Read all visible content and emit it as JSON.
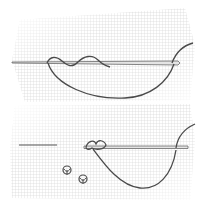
{
  "illustration": {
    "subject": "embroidery stitch diagram",
    "panels": [
      {
        "id": "top",
        "elements": [
          "fabric-grid",
          "needle",
          "wrapped-thread",
          "thread-loop"
        ]
      },
      {
        "id": "bottom",
        "elements": [
          "fabric-grid",
          "needle",
          "knot",
          "thread-loop",
          "finished-knots"
        ]
      }
    ],
    "colors": {
      "background": "#ffffff",
      "grid": "#c8c8c8",
      "thread": "#4a4a4a",
      "needle": "#6a6a6a",
      "needle_fill": "#e0e0e0"
    }
  }
}
